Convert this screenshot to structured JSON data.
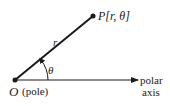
{
  "diagram": {
    "type": "polar-coordinate-system",
    "point_label": "P[r, θ]",
    "radius_label": "r",
    "angle_label": "θ",
    "pole_letter": "O",
    "pole_label": "(pole)",
    "axis_label_line1": "polar",
    "axis_label_line2": "axis",
    "colors": {
      "ink": "#1a1a1a",
      "background": "#ffffff"
    }
  }
}
